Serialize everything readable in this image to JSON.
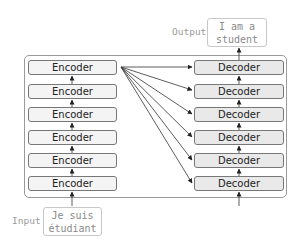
{
  "diagram": {
    "encoders": [
      "Encoder",
      "Encoder",
      "Encoder",
      "Encoder",
      "Encoder",
      "Encoder"
    ],
    "decoders": [
      "Decoder",
      "Decoder",
      "Decoder",
      "Decoder",
      "Decoder",
      "Decoder"
    ],
    "input": {
      "label": "Input",
      "line1": "Je suis",
      "line2": "étudiant"
    },
    "output": {
      "label": "Output",
      "line1": "I am a",
      "line2": "student"
    }
  }
}
